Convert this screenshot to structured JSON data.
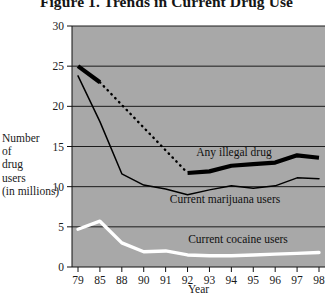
{
  "figure": {
    "title": "Figure 1. Trends in Current Drug Use",
    "background_color": "#a8a8a8",
    "page_color": "#ffffff"
  },
  "chart_data": {
    "type": "line",
    "title": "Figure 1. Trends in Current Drug Use",
    "xlabel": "Year",
    "ylabel": "Number of drug users (in millions)",
    "ylabel_lines": [
      "Number",
      "of",
      "drug",
      "users",
      "(in millions)"
    ],
    "categories": [
      "79",
      "85",
      "88",
      "90",
      "91",
      "92",
      "93",
      "94",
      "95",
      "96",
      "97",
      "98"
    ],
    "xtick_labels": [
      "79",
      "85",
      "88",
      "90",
      "91",
      "92",
      "93",
      "94",
      "95",
      "96",
      "97",
      "98"
    ],
    "ytick_labels": [
      "0",
      "5",
      "10",
      "15",
      "20",
      "25",
      "30"
    ],
    "ylim": [
      0,
      30
    ],
    "ytick_values": [
      0,
      5,
      10,
      15,
      20,
      25,
      30
    ],
    "grid": true,
    "grid_axis": "y",
    "legend": "inline-annotations",
    "series": [
      {
        "name": "Any illegal drug",
        "color": "#000000",
        "style": "thick-solid-with-dotted-gap",
        "label": "Any illegal drug",
        "values": [
          25.0,
          23.0,
          null,
          null,
          null,
          11.7,
          11.9,
          12.6,
          12.8,
          13.0,
          13.9,
          13.6
        ],
        "solid_segments": [
          [
            {
              "x": "79",
              "y": 25.0
            },
            {
              "x": "85",
              "y": 23.0
            }
          ],
          [
            {
              "x": "92",
              "y": 11.7
            },
            {
              "x": "93",
              "y": 11.9
            },
            {
              "x": "94",
              "y": 12.6
            },
            {
              "x": "95",
              "y": 12.8
            },
            {
              "x": "96",
              "y": 13.0
            },
            {
              "x": "97",
              "y": 13.9
            },
            {
              "x": "98",
              "y": 13.6
            }
          ]
        ],
        "dotted_segment": [
          {
            "x": "85",
            "y": 23.0
          },
          {
            "x": "92",
            "y": 11.7
          }
        ]
      },
      {
        "name": "Current marijuana users",
        "color": "#000000",
        "style": "thin-solid",
        "label": "Current marijuana users",
        "values": [
          23.8,
          18.1,
          11.6,
          10.2,
          9.7,
          9.0,
          9.6,
          10.1,
          9.8,
          10.1,
          11.1,
          11.0
        ]
      },
      {
        "name": "Current cocaine users",
        "color": "#ffffff",
        "style": "thick-solid-white",
        "label": "Current cocaine users",
        "values": [
          4.7,
          5.7,
          3.0,
          1.9,
          2.0,
          1.5,
          1.4,
          1.4,
          1.5,
          1.6,
          1.7,
          1.8
        ]
      }
    ]
  }
}
